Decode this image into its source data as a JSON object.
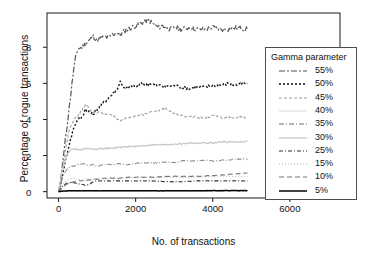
{
  "chart_data": {
    "type": "line",
    "title": "",
    "xlabel": "No. of transactions",
    "ylabel": "Percentage of rogue transactions",
    "xlim": [
      -300,
      7300
    ],
    "ylim": [
      -0.35,
      9.9
    ],
    "xticks": [
      0,
      2000,
      4000,
      6000
    ],
    "xticklabels": [
      "0",
      "2000",
      "4000",
      "6000"
    ],
    "yticks": [
      0,
      2,
      4,
      6,
      8
    ],
    "yticklabels": [
      "0",
      "2",
      "4",
      "6",
      "8"
    ],
    "grid": false,
    "legend_position": "right-inside",
    "legend_title": "Gamma parameter",
    "x_data_max": 4900,
    "series": [
      {
        "name": "55%",
        "label": "55%",
        "color": "#555555",
        "dash": "6,2,2,2",
        "width": 1.2,
        "plateau": 9.0,
        "x": [
          0,
          50,
          100,
          150,
          200,
          250,
          300,
          350,
          400,
          450,
          500,
          600,
          700,
          800,
          900,
          1000,
          1100,
          1200,
          1300,
          1400,
          1500,
          1600,
          1700,
          1800,
          1900,
          2000,
          2100,
          2200,
          2300,
          2400,
          2500,
          2600,
          2700,
          2800,
          2900,
          3000,
          3200,
          3400,
          3600,
          3800,
          4000,
          4200,
          4400,
          4600,
          4900
        ],
        "values": [
          0.0,
          0.6,
          1.5,
          2.4,
          3.3,
          4.2,
          5.1,
          6.0,
          6.9,
          7.5,
          7.9,
          8.0,
          8.2,
          8.4,
          8.6,
          8.4,
          8.5,
          8.6,
          8.5,
          8.7,
          8.8,
          8.7,
          8.9,
          9.0,
          9.1,
          9.2,
          9.3,
          9.4,
          9.5,
          9.4,
          9.2,
          9.1,
          9.2,
          9.1,
          9.0,
          9.1,
          9.0,
          9.1,
          9.0,
          9.0,
          9.1,
          9.0,
          9.0,
          9.1,
          9.0
        ]
      },
      {
        "name": "50%",
        "label": "50%",
        "color": "#111111",
        "dash": "2,2",
        "width": 1.4,
        "plateau": 5.9,
        "x": [
          0,
          50,
          100,
          150,
          200,
          250,
          300,
          350,
          400,
          500,
          600,
          700,
          800,
          900,
          1000,
          1100,
          1200,
          1300,
          1400,
          1500,
          1600,
          1700,
          1800,
          1900,
          2000,
          2100,
          2200,
          2300,
          2400,
          2500,
          2600,
          2800,
          3000,
          3200,
          3400,
          3600,
          3800,
          4000,
          4200,
          4400,
          4600,
          4900
        ],
        "values": [
          0.0,
          0.4,
          0.9,
          1.4,
          1.9,
          2.4,
          2.8,
          3.2,
          3.6,
          4.0,
          4.1,
          4.6,
          4.4,
          4.3,
          4.6,
          4.8,
          5.0,
          5.2,
          5.4,
          5.6,
          6.1,
          5.8,
          5.7,
          5.9,
          5.8,
          5.9,
          6.0,
          5.9,
          6.0,
          5.9,
          5.9,
          5.8,
          5.9,
          5.8,
          5.7,
          5.8,
          5.8,
          5.9,
          5.9,
          6.0,
          5.9,
          6.0
        ]
      },
      {
        "name": "45%",
        "label": "45%",
        "color": "#9e9e9e",
        "dash": "3,2",
        "width": 1.1,
        "plateau": 4.1,
        "x": [
          0,
          50,
          100,
          150,
          200,
          250,
          300,
          400,
          500,
          600,
          700,
          800,
          900,
          1000,
          1200,
          1400,
          1500,
          1600,
          1800,
          2000,
          2200,
          2400,
          2600,
          2800,
          2900,
          3000,
          3200,
          3400,
          3600,
          3800,
          4000,
          4200,
          4400,
          4600,
          4900
        ],
        "values": [
          0.0,
          0.5,
          1.2,
          1.9,
          2.6,
          3.2,
          3.6,
          4.0,
          4.2,
          4.5,
          4.8,
          4.6,
          4.4,
          4.4,
          4.3,
          4.3,
          4.0,
          3.9,
          4.1,
          4.2,
          4.3,
          4.4,
          4.5,
          4.6,
          4.5,
          4.3,
          4.2,
          4.2,
          4.1,
          4.1,
          4.2,
          4.1,
          4.1,
          4.1,
          4.1
        ]
      },
      {
        "name": "40%",
        "label": "40%",
        "color": "#d8d8d8",
        "dash": "0",
        "width": 1.0,
        "plateau": 0.03,
        "x": [
          0,
          100,
          300,
          600,
          1000,
          1500,
          2000,
          2500,
          3000,
          3500,
          4000,
          4500,
          4900
        ],
        "values": [
          0.0,
          0.02,
          0.03,
          0.03,
          0.03,
          0.03,
          0.03,
          0.03,
          0.03,
          0.03,
          0.03,
          0.03,
          0.03
        ]
      },
      {
        "name": "35%",
        "label": "35%",
        "color": "#6b6b6b",
        "dash": "5,2,1,2",
        "width": 1.0,
        "plateau": 1.8,
        "x": [
          0,
          50,
          100,
          200,
          300,
          400,
          500,
          600,
          700,
          800,
          900,
          1000,
          1200,
          1400,
          1600,
          1800,
          2000,
          2200,
          2400,
          2600,
          2800,
          3000,
          3200,
          3400,
          3600,
          3800,
          4000,
          4200,
          4400,
          4600,
          4900
        ],
        "values": [
          0.0,
          0.4,
          0.8,
          1.2,
          1.4,
          1.4,
          1.5,
          1.55,
          1.5,
          1.45,
          1.5,
          1.4,
          1.5,
          1.5,
          1.55,
          1.5,
          1.55,
          1.6,
          1.6,
          1.6,
          1.65,
          1.6,
          1.7,
          1.7,
          1.7,
          1.75,
          1.7,
          1.75,
          1.75,
          1.8,
          1.8
        ]
      },
      {
        "name": "30%",
        "label": "30%",
        "color": "#c4c4c4",
        "dash": "0",
        "width": 1.2,
        "plateau": 2.7,
        "x": [
          0,
          50,
          100,
          200,
          300,
          400,
          500,
          600,
          800,
          1000,
          1200,
          1400,
          1600,
          1800,
          2000,
          2200,
          2400,
          2600,
          2800,
          3000,
          3200,
          3400,
          3600,
          3800,
          4000,
          4200,
          4400,
          4600,
          4900
        ],
        "values": [
          0.0,
          0.6,
          1.2,
          2.0,
          2.3,
          2.4,
          2.3,
          2.35,
          2.4,
          2.35,
          2.4,
          2.4,
          2.45,
          2.5,
          2.5,
          2.55,
          2.6,
          2.6,
          2.6,
          2.65,
          2.65,
          2.7,
          2.7,
          2.7,
          2.7,
          2.75,
          2.75,
          2.75,
          2.8
        ]
      },
      {
        "name": "25%",
        "label": "25%",
        "color": "#2b2b2b",
        "dash": "4,2,1,2",
        "width": 1.1,
        "plateau": 0.6,
        "x": [
          0,
          50,
          100,
          200,
          300,
          400,
          500,
          600,
          700,
          800,
          900,
          1000,
          1200,
          1400,
          1600,
          1800,
          2000,
          2400,
          2800,
          3200,
          3600,
          4000,
          4400,
          4900
        ],
        "values": [
          0.0,
          0.15,
          0.3,
          0.45,
          0.5,
          0.5,
          0.45,
          0.4,
          0.35,
          0.4,
          0.55,
          0.6,
          0.6,
          0.6,
          0.6,
          0.6,
          0.6,
          0.6,
          0.55,
          0.55,
          0.6,
          0.6,
          0.6,
          0.6
        ]
      },
      {
        "name": "15%",
        "label": "15%",
        "color": "#b0b0b0",
        "dash": "1,2",
        "width": 1.0,
        "plateau": 0.85,
        "x": [
          0,
          50,
          100,
          200,
          300,
          400,
          500,
          600,
          700,
          800,
          1000,
          1200,
          1400,
          1600,
          1800,
          2000,
          2400,
          2800,
          3200,
          3600,
          4000,
          4400,
          4900
        ],
        "values": [
          0.0,
          0.2,
          0.4,
          0.6,
          0.7,
          0.75,
          0.7,
          0.65,
          0.6,
          0.65,
          0.7,
          0.7,
          0.75,
          0.75,
          0.75,
          0.8,
          0.8,
          0.8,
          0.8,
          0.8,
          0.85,
          0.85,
          0.85
        ]
      },
      {
        "name": "10%",
        "label": "10%",
        "color": "#767676",
        "dash": "5,3",
        "width": 1.1,
        "plateau": 1.0,
        "x": [
          0,
          50,
          100,
          200,
          300,
          400,
          500,
          600,
          700,
          800,
          900,
          1000,
          1200,
          1400,
          1600,
          1800,
          2000,
          2400,
          2800,
          3200,
          3600,
          4000,
          4400,
          4700,
          4900
        ],
        "values": [
          0.0,
          0.1,
          0.25,
          0.4,
          0.5,
          0.55,
          0.6,
          0.6,
          0.65,
          0.65,
          0.7,
          0.7,
          0.75,
          0.75,
          0.75,
          0.8,
          0.8,
          0.8,
          0.85,
          0.85,
          0.85,
          0.9,
          0.95,
          1.0,
          1.05
        ]
      },
      {
        "name": "5%",
        "label": "5%",
        "color": "#000000",
        "dash": "0",
        "width": 1.5,
        "plateau": 0.05,
        "x": [
          0,
          100,
          300,
          600,
          1000,
          1500,
          2000,
          2500,
          3000,
          3500,
          4000,
          4500,
          4900
        ],
        "values": [
          0.0,
          0.03,
          0.05,
          0.05,
          0.05,
          0.05,
          0.05,
          0.05,
          0.05,
          0.05,
          0.06,
          0.06,
          0.06
        ]
      }
    ]
  },
  "axes": {
    "xlabel": "No. of transactions",
    "ylabel": "Percentage of rogue transactions",
    "xtick_labels": [
      "0",
      "2000",
      "4000",
      "6000"
    ],
    "ytick_labels": [
      "0",
      "2",
      "4",
      "6",
      "8"
    ]
  },
  "legend": {
    "title": "Gamma parameter",
    "items": [
      {
        "label": "55%"
      },
      {
        "label": "50%"
      },
      {
        "label": "45%"
      },
      {
        "label": "40%"
      },
      {
        "label": "35%"
      },
      {
        "label": "30%"
      },
      {
        "label": "25%"
      },
      {
        "label": "15%"
      },
      {
        "label": "10%"
      },
      {
        "label": "5%"
      }
    ]
  },
  "colors": {
    "background": "#ffffff",
    "axis": "#1a1a1a",
    "text": "#111111",
    "legend_border": "#4d4d4d"
  }
}
